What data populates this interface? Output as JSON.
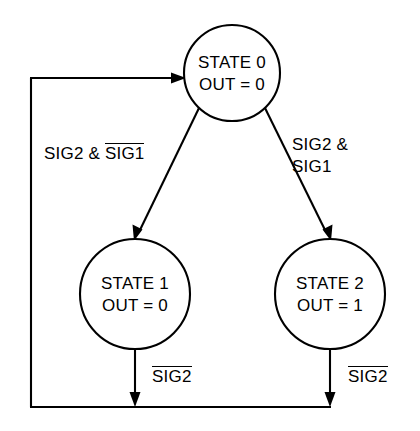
{
  "diagram": {
    "type": "state-transition-diagram",
    "background_color": "#ffffff",
    "line_color": "#000000",
    "nodes": [
      {
        "id": "state0",
        "name": "STATE 0",
        "line1": "STATE 0",
        "line2": "OUT = 0",
        "output": "0",
        "cx": 232,
        "cy": 73,
        "r": 48
      },
      {
        "id": "state1",
        "name": "STATE 1",
        "line1": "STATE 1",
        "line2": "OUT = 0",
        "output": "0",
        "cx": 135,
        "cy": 294,
        "r": 55
      },
      {
        "id": "state2",
        "name": "STATE 2",
        "line1": "STATE 2",
        "line2": "OUT = 1",
        "output": "1",
        "cx": 330,
        "cy": 294,
        "r": 55
      }
    ],
    "transitions": [
      {
        "id": "t-state0-to-state1",
        "from": "STATE 0",
        "to": "STATE 1",
        "condition_prefix": "SIG2 & ",
        "condition_overlined": "SIG1",
        "condition_text": "SIG2 & NOT SIG1"
      },
      {
        "id": "t-state0-to-state2",
        "from": "STATE 0",
        "to": "STATE 2",
        "condition_line1": "SIG2 &",
        "condition_line2": "SIG1",
        "condition_text": "SIG2 & SIG1"
      },
      {
        "id": "t-state1-to-state0",
        "from": "STATE 1",
        "to": "STATE 0",
        "condition_overlined": "SIG2",
        "condition_text": "NOT SIG2"
      },
      {
        "id": "t-state2-to-state0",
        "from": "STATE 2",
        "to": "STATE 0",
        "condition_overlined": "SIG2",
        "condition_text": "NOT SIG2"
      }
    ]
  }
}
